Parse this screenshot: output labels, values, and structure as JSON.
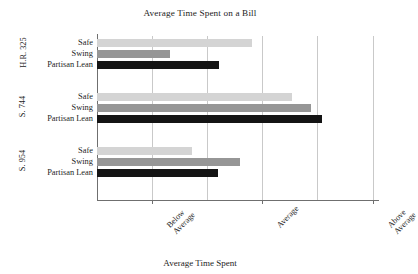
{
  "chart_data": {
    "type": "bar",
    "orientation": "horizontal",
    "title": "Average Time Spent on a Bill",
    "xlabel": "Average Time Spent",
    "ylabel": "",
    "grid": true,
    "legend": "none",
    "xlim": [
      0.5,
      3.05
    ],
    "xticks": [
      1,
      2,
      3
    ],
    "xtick_labels": [
      "Below Average",
      "Average",
      "Above Average"
    ],
    "minor_gridlines": [
      1.5,
      2.5
    ],
    "groups": [
      {
        "label": "H.R. 325",
        "categories": [
          "Safe",
          "Swing",
          "Partisan Lean"
        ],
        "values": [
          1.91,
          1.16,
          1.61
        ]
      },
      {
        "label": "S. 744",
        "categories": [
          "Safe",
          "Swing",
          "Partisan Lean"
        ],
        "values": [
          2.27,
          2.44,
          2.54
        ]
      },
      {
        "label": "S. 954",
        "categories": [
          "Safe",
          "Swing",
          "Partisan Lean"
        ],
        "values": [
          1.36,
          1.8,
          1.6
        ]
      }
    ],
    "series_colors": {
      "Safe": "#d4d4d4",
      "Swing": "#969696",
      "Partisan Lean": "#141414"
    },
    "axis_color": "#6f6f6f",
    "grid_color": "#c9c9c9"
  }
}
